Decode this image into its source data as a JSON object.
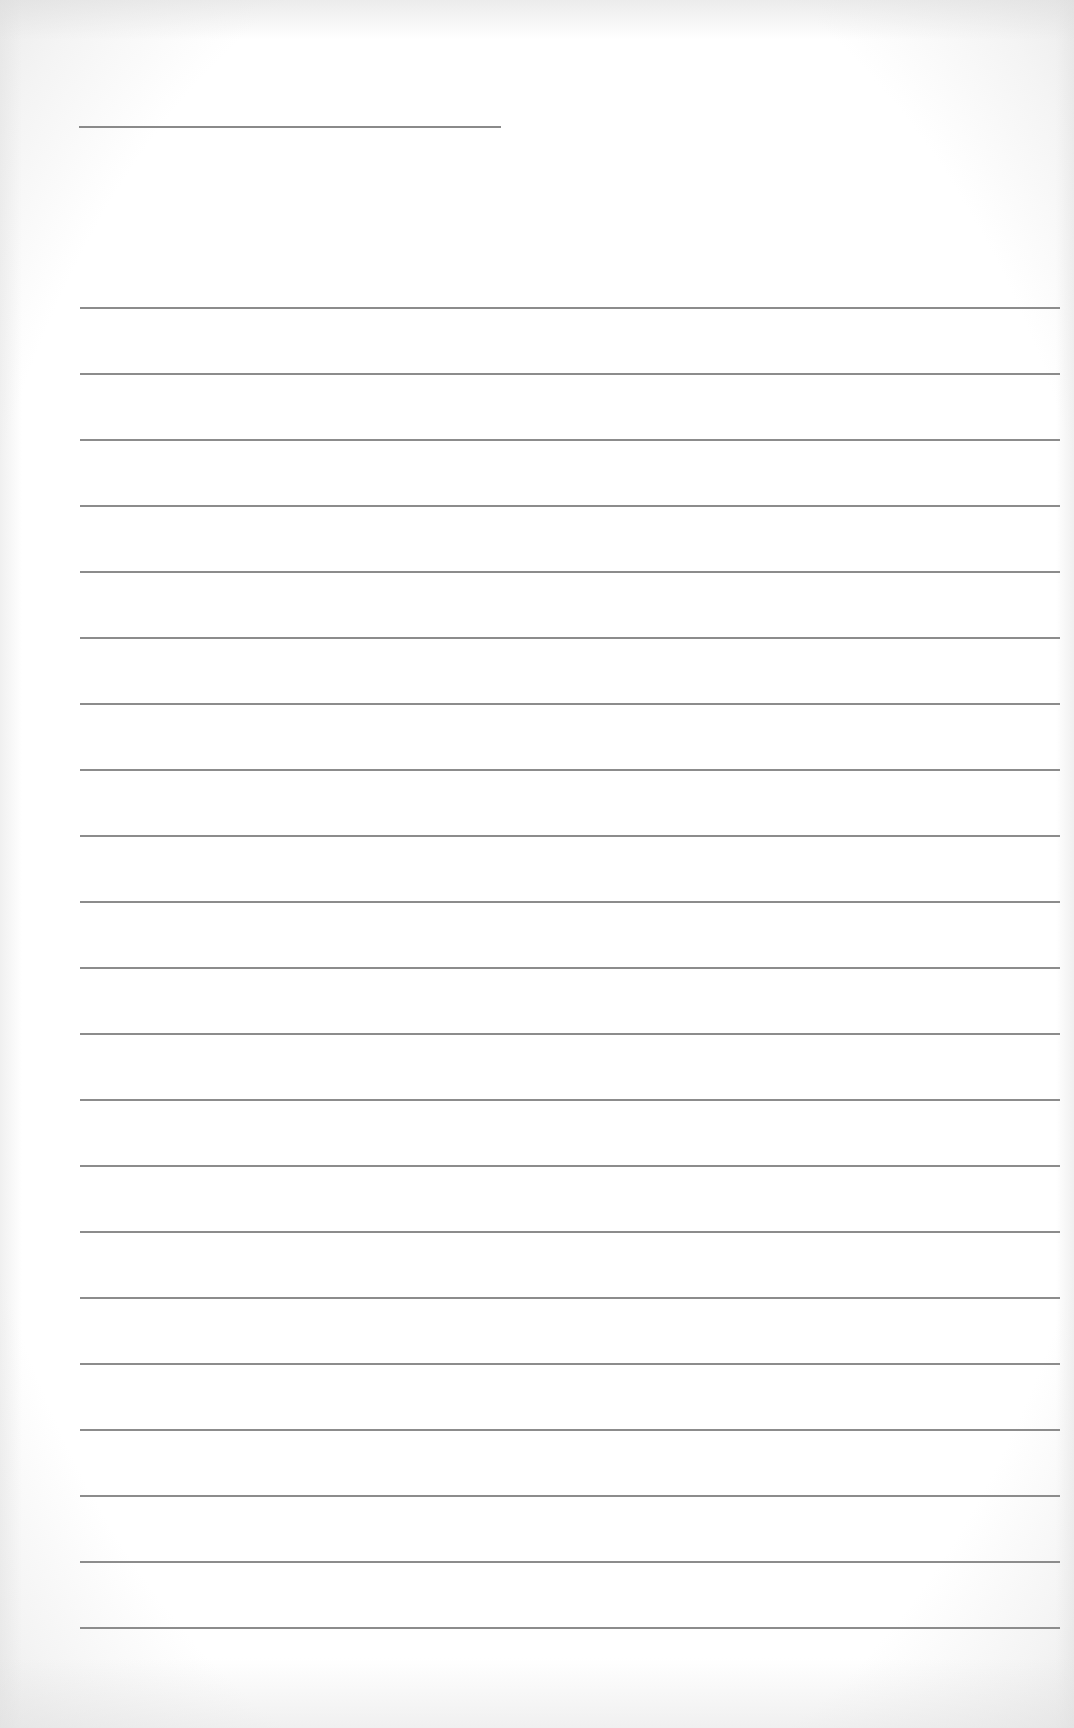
{
  "document": {
    "type": "lined-paper",
    "paper_color": "#ffffff",
    "line_color": "#8c8c8c"
  },
  "header": {
    "title_line": {
      "value": "",
      "x": 79,
      "y": 126,
      "width": 422
    }
  },
  "lines": {
    "count": 21,
    "first_y": 307,
    "spacing": 66,
    "x": 80,
    "width": 980,
    "values": [
      "",
      "",
      "",
      "",
      "",
      "",
      "",
      "",
      "",
      "",
      "",
      "",
      "",
      "",
      "",
      "",
      "",
      "",
      "",
      "",
      ""
    ]
  }
}
